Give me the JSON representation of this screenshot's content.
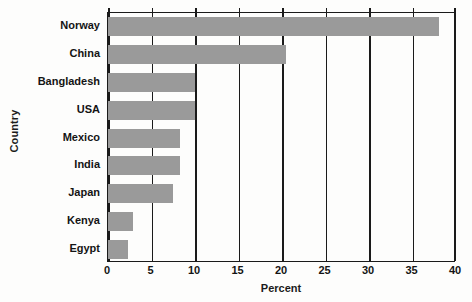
{
  "chart_data": {
    "type": "bar",
    "orientation": "horizontal",
    "title": "",
    "xlabel": "Percent",
    "ylabel": "Country",
    "categories": [
      "Norway",
      "China",
      "Bangladesh",
      "USA",
      "Mexico",
      "India",
      "Japan",
      "Kenya",
      "Egypt"
    ],
    "values": [
      38.0,
      20.5,
      10.0,
      10.0,
      8.3,
      8.3,
      7.5,
      2.9,
      2.3
    ],
    "xlim": [
      0,
      40
    ],
    "xticks": [
      0,
      5,
      10,
      15,
      20,
      25,
      30,
      35,
      40
    ],
    "xticklabels": [
      "0",
      "5",
      "10",
      "15",
      "20",
      "25",
      "30",
      "35",
      "40"
    ],
    "grid": true,
    "grid_axis": "x",
    "legend": false,
    "bar_color": "#9a9a9a",
    "axis_color": "#1a1a1a",
    "background_color": "#fdfdfc"
  }
}
